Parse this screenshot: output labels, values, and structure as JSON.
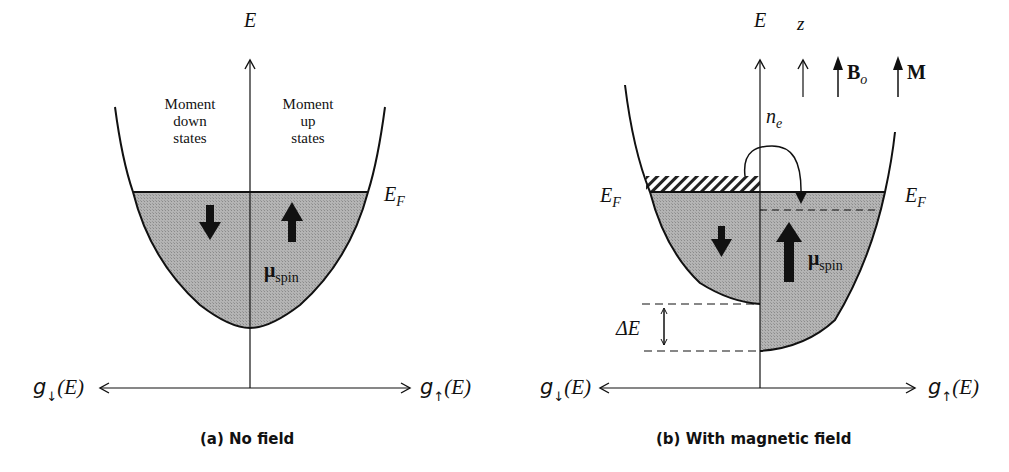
{
  "panel_a": {
    "caption": "(a) No field",
    "axis_label_vertical": "E",
    "axis_label_left": {
      "g": "g",
      "arrow": "↓",
      "arg": "(E)"
    },
    "axis_label_right": {
      "g": "g",
      "arrow": "↑",
      "arg": "(E)"
    },
    "fermi_label": {
      "main": "E",
      "sub": "F"
    },
    "region_left": [
      "Moment",
      "down",
      "states"
    ],
    "region_right": [
      "Moment",
      "up",
      "states"
    ],
    "moment_label": {
      "main": "μ",
      "sub": "spin"
    }
  },
  "panel_b": {
    "caption": "(b) With magnetic field",
    "axis_label_vertical": "E",
    "axis_label_left": {
      "g": "g",
      "arrow": "↓",
      "arg": "(E)"
    },
    "axis_label_right": {
      "g": "g",
      "arrow": "↑",
      "arg": "(E)"
    },
    "fermi_label_left": {
      "main": "E",
      "sub": "F"
    },
    "fermi_label_right": {
      "main": "E",
      "sub": "F"
    },
    "z_label": "z",
    "field_label": {
      "main": "B",
      "sub": "o"
    },
    "magnetization_label": "M",
    "transfer_label": {
      "main": "n",
      "sub": "e"
    },
    "delta_label": "ΔE",
    "moment_label": {
      "main": "μ",
      "sub": "spin"
    }
  },
  "colors": {
    "fill": "#a9a9a9",
    "line": "#111111",
    "background": "#ffffff"
  }
}
